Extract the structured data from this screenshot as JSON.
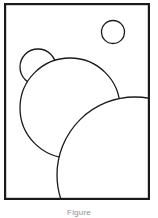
{
  "figure": {
    "background_color": "#ffffff",
    "stroke_color": "#1a1a1a",
    "fill_color": "#ffffff",
    "frame": {
      "label": "figure-frame",
      "x": 4,
      "y": 3,
      "width": 146,
      "height": 197,
      "stroke_width": 2.2
    },
    "shapes": [
      {
        "name": "circle-small-top-right",
        "label": "Small circle (upper right)",
        "cx": 113,
        "cy": 32,
        "r": 11.5,
        "stroke_width": 1.3
      },
      {
        "name": "circle-small-left",
        "label": "Small circle (upper left)",
        "cx": 38,
        "cy": 67,
        "r": 18,
        "stroke_width": 1.3
      },
      {
        "name": "circle-medium",
        "label": "Medium circle (center left)",
        "cx": 70,
        "cy": 108,
        "r": 50,
        "stroke_width": 1.3
      },
      {
        "name": "circle-large",
        "label": "Large circle (lower right)",
        "cx": 135,
        "cy": 175,
        "r": 78,
        "stroke_width": 1.3
      }
    ]
  },
  "caption": {
    "text": "Figure"
  }
}
